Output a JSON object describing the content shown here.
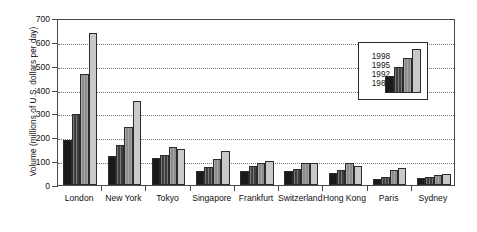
{
  "chart_data": {
    "type": "bar",
    "title": "",
    "subtitle": "",
    "xlabel": "",
    "ylabel": "Volume (millions of U.S. dollars per day)",
    "ylim": [
      0,
      700
    ],
    "ytick_step": 100,
    "yticks": [
      "0",
      "100",
      "200",
      "300",
      "400",
      "500",
      "600",
      "700"
    ],
    "grid": true,
    "grid_axis": "y",
    "grid_style": "dotted",
    "legend_position": "inside-top-right",
    "legend_title": "",
    "categories": [
      "London",
      "New York",
      "Tokyo",
      "Singapore",
      "Frankfurt",
      "Switzerland",
      "Hong Kong",
      "Paris",
      "Sydney"
    ],
    "series": [
      {
        "name": "1989",
        "color": "#1a1a1a",
        "values": [
          187,
          120,
          115,
          60,
          57,
          57,
          49,
          26,
          30
        ]
      },
      {
        "name": "1992",
        "color": "#3f3f3f",
        "values": [
          297,
          167,
          126,
          76,
          79,
          68,
          63,
          35,
          34
        ]
      },
      {
        "name": "1995",
        "color": "#8d8d8d",
        "values": [
          465,
          244,
          161,
          107,
          94,
          92,
          91,
          61,
          42
        ]
      },
      {
        "name": "1998",
        "color": "#c9c9c9",
        "values": [
          637,
          351,
          149,
          141,
          99,
          94,
          79,
          72,
          47
        ]
      }
    ]
  },
  "legend": {
    "entries": [
      "1998",
      "1995",
      "1992",
      "1989"
    ]
  }
}
